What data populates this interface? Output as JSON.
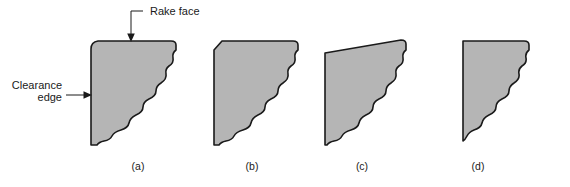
{
  "figure": {
    "background_color": "#ffffff",
    "width": 570,
    "height": 187
  },
  "style": {
    "fill_color": "#b5b5b5",
    "outline_color": "#1a1a1a",
    "text_color": "#1a1a1a",
    "leader_color": "#1a1a1a"
  },
  "annotations": {
    "rake_face": {
      "label": "Rake face",
      "text_x": 150,
      "text_y": 15,
      "leader_path": "M 143 11 L 131 11 L 131 34",
      "arrow_points": "131,42 127.2,33.5 134.8,33.5",
      "target_shape": "a",
      "points_to": "top-edge"
    },
    "clearance_edge": {
      "label_line_1": "Clearance",
      "label_line_2": "edge",
      "text_x": 62,
      "text_y_line_1": 89,
      "text_y_line_2": 101,
      "leader_path": "M 66 95 L 84 95",
      "arrow_points": "92,95 83.5,91.2 83.5,98.8",
      "target_shape": "a",
      "points_to": "left-edge"
    }
  },
  "chart_data": {
    "type": "diagram",
    "shape_count": 4,
    "shapes": [
      {
        "caption": "(a)",
        "caption_x": 138,
        "caption_y": 170,
        "top_left_corner": "small-chamfer",
        "top_edge": "horizontal",
        "left_edge": "vertical-straight",
        "wear_edge": "wavy-scalloped-diagonal",
        "path": "M 91 49 Q 91 42 98 41 L 171 41 Q 176 41 176 45 L 176 50 Q 172 53 173 58 Q 174 63 169 66 Q 165 69 166 74 Q 167 79 161 83 Q 156 86 156 91 Q 156 96 149 99 Q 143 102 143 107 Q 143 112 136 115 Q 130 118 129 123 Q 128 128 121 130 Q 114 132 112 136 Q 110 140 104 141 Q 99 142 97 145 L 91 145 Z"
      },
      {
        "caption": "(b)",
        "caption_x": 252,
        "caption_y": 170,
        "top_left_corner": "large-chamfer",
        "top_edge": "horizontal",
        "left_edge": "vertical-straight",
        "wear_edge": "wavy-scalloped-diagonal",
        "path": "M 214 50 L 222 41 L 293 41 Q 298 41 298 45 L 298 50 Q 294 53 295 58 Q 296 63 291 66 Q 287 69 288 74 Q 289 79 283 83 Q 278 86 278 91 Q 278 96 271 99 Q 265 102 265 107 Q 265 112 258 115 Q 252 118 251 123 Q 250 128 243 130 Q 236 132 234 136 Q 232 140 226 141 Q 221 142 219 145 L 214 145 Z"
      },
      {
        "caption": "(c)",
        "caption_x": 362,
        "caption_y": 170,
        "top_left_corner": "sharp",
        "top_edge": "sloped-up-to-right",
        "left_edge": "vertical-straight",
        "wear_edge": "wavy-scalloped-diagonal",
        "path": "M 325 53 L 401 40 Q 406 40 406 44 L 406 50 Q 402 53 403 58 Q 404 63 399 66 Q 395 69 396 74 Q 397 79 391 83 Q 386 86 386 91 Q 386 96 379 99 Q 373 102 373 107 Q 373 112 366 115 Q 360 118 359 123 Q 358 128 351 130 Q 344 132 342 136 Q 340 140 334 141 Q 329 142 327 145 L 325 145 Z"
      },
      {
        "caption": "(d)",
        "caption_x": 478,
        "caption_y": 170,
        "top_left_corner": "sharp-square",
        "top_edge": "horizontal",
        "left_edge": "vertical-straight",
        "wear_edge": "wavy-scalloped-diagonal",
        "path": "M 463 41 L 524 41 Q 529 41 529 45 L 529 50 Q 525 53 526 58 Q 527 63 522 66 Q 518 69 519 74 Q 520 79 514 83 Q 509 86 509 91 Q 509 96 502 99 Q 496 102 496 107 Q 496 112 489 115 Q 483 118 482 123 Q 481 128 474 130 Q 469 132 467 136 Q 465 140 463 141 Z"
      }
    ]
  }
}
